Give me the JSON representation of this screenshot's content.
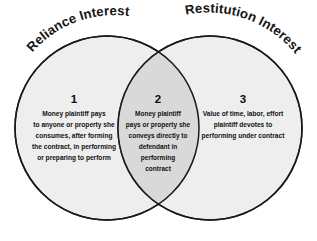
{
  "diagram": {
    "type": "venn-diagram",
    "sets": 2,
    "background_color": "#ffffff",
    "circle_fill": "#eeeeee",
    "overlap_fill": "#d9d9d9",
    "stroke_color": "#1a1a1a",
    "left_label": "Reliance Interest",
    "right_label": "Restitution Interest",
    "regions": [
      {
        "number": "1",
        "region": "left-only",
        "lines": [
          "Money plaintiff pays",
          "to anyone or property she",
          "consumes, after forming",
          "the contract, in performing",
          "or preparing to perform"
        ]
      },
      {
        "number": "2",
        "region": "overlap",
        "lines": [
          "Money plaintiff",
          "pays or property she",
          "conveys directly to",
          "defendant in",
          "performing",
          "contract"
        ]
      },
      {
        "number": "3",
        "region": "right-only",
        "lines": [
          "Value of time, labor, effort",
          "plaintiff devotes to",
          "performing under contract"
        ]
      }
    ]
  }
}
